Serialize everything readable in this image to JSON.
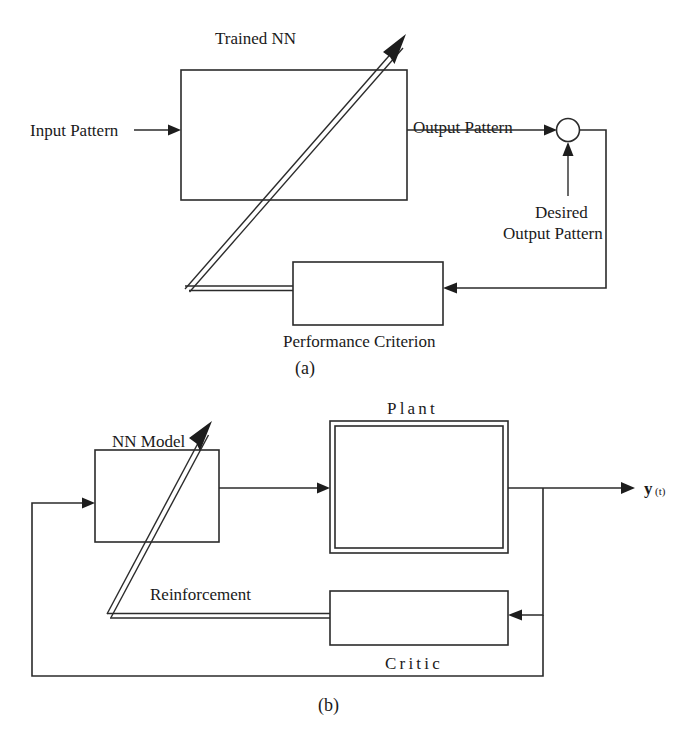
{
  "figure": {
    "kind": "block-diagram",
    "panels": [
      {
        "id": "a",
        "caption": "(a)",
        "title_label": "Trained NN",
        "blocks": [
          {
            "name": "trained-nn",
            "label": "Trained NN",
            "label_position": "above"
          },
          {
            "name": "performance-criterion",
            "label": "Performance Criterion",
            "label_position": "below"
          }
        ],
        "signals": [
          {
            "name": "input-pattern",
            "label": "Input Pattern"
          },
          {
            "name": "output-pattern",
            "label": "Output Pattern"
          },
          {
            "name": "desired-output-pattern",
            "label_line1": "Desired",
            "label_line2": "Output Pattern"
          }
        ],
        "summing_junction": {
          "name": "summing-junction",
          "shape": "circle"
        }
      },
      {
        "id": "b",
        "caption": "(b)",
        "blocks": [
          {
            "name": "nn-model",
            "label": "NN Model",
            "label_position": "above"
          },
          {
            "name": "plant",
            "label": "Plant",
            "label_position": "above",
            "border": "double"
          },
          {
            "name": "critic",
            "label": "Critic",
            "label_position": "below"
          }
        ],
        "signals": [
          {
            "name": "reinforcement",
            "label": "Reinforcement"
          },
          {
            "name": "plant-output",
            "label": "y(t)",
            "label_main": "y",
            "label_sub": "(t)"
          }
        ]
      }
    ]
  },
  "labels": {
    "trained_nn": "Trained NN",
    "input_pattern": "Input Pattern",
    "output_pattern": "Output Pattern",
    "desired_1": "Desired",
    "desired_2": "Output Pattern",
    "performance_criterion": "Performance Criterion",
    "caption_a": "(a)",
    "nn_model": "NN Model",
    "plant": "Plant",
    "critic": "Critic",
    "reinforcement": "Reinforcement",
    "y_main": "y",
    "y_sub": "(t)",
    "caption_b": "(b)"
  },
  "colors": {
    "ink": "#2b2b2b",
    "fill": "#ffffff",
    "text": "#1a1a1a"
  }
}
